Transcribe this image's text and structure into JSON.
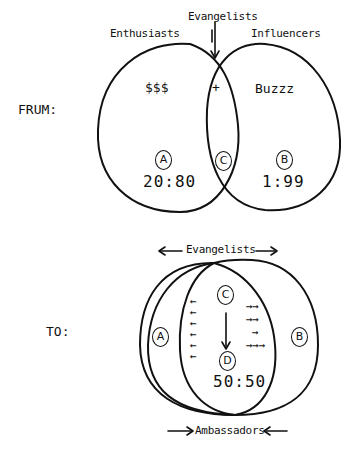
{
  "from_section": {
    "side_label": "FRUM:",
    "left_circle": {
      "title": "Enthusiasts",
      "content": "$$$",
      "tag": "A",
      "ratio": "20:80"
    },
    "right_circle": {
      "title": "Influencers",
      "content": "Buzzz",
      "tag": "B",
      "ratio": "1:99"
    },
    "overlap": {
      "title": "Evangelists",
      "content": "+",
      "tag": "C"
    }
  },
  "to_section": {
    "side_label": "TO:",
    "top_label": "Evangelists",
    "bottom_label": "Ambassadors",
    "left_tag": "A",
    "right_tag": "B",
    "center_top_tag": "C",
    "center_bottom_tag": "D",
    "center_ratio": "50:50",
    "left_arrows": [
      "←",
      "←",
      "←",
      "←",
      "←",
      "←"
    ],
    "right_arrows": [
      "→→",
      "→→",
      "→",
      "→→→"
    ]
  }
}
